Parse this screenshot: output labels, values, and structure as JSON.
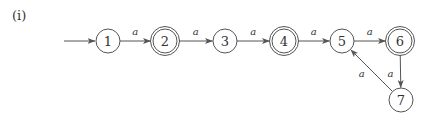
{
  "figure": {
    "label": "(i)",
    "type": "finite automaton",
    "stroke_color": "#555555"
  },
  "states": [
    {
      "id": "1",
      "label": "1",
      "accepting": false,
      "initial": true,
      "x": 108,
      "y": 41
    },
    {
      "id": "2",
      "label": "2",
      "accepting": true,
      "initial": false,
      "x": 165,
      "y": 41
    },
    {
      "id": "3",
      "label": "3",
      "accepting": false,
      "initial": false,
      "x": 225,
      "y": 41
    },
    {
      "id": "4",
      "label": "4",
      "accepting": true,
      "initial": false,
      "x": 284,
      "y": 41
    },
    {
      "id": "5",
      "label": "5",
      "accepting": false,
      "initial": false,
      "x": 342,
      "y": 41
    },
    {
      "id": "6",
      "label": "6",
      "accepting": true,
      "initial": false,
      "x": 400,
      "y": 41
    },
    {
      "id": "7",
      "label": "7",
      "accepting": false,
      "initial": false,
      "x": 401,
      "y": 100
    }
  ],
  "transitions": [
    {
      "from": "1",
      "to": "2",
      "label": "a"
    },
    {
      "from": "2",
      "to": "3",
      "label": "a"
    },
    {
      "from": "3",
      "to": "4",
      "label": "a"
    },
    {
      "from": "4",
      "to": "5",
      "label": "a"
    },
    {
      "from": "5",
      "to": "6",
      "label": "a"
    },
    {
      "from": "6",
      "to": "7",
      "label": "a"
    },
    {
      "from": "7",
      "to": "5",
      "label": "a"
    }
  ]
}
